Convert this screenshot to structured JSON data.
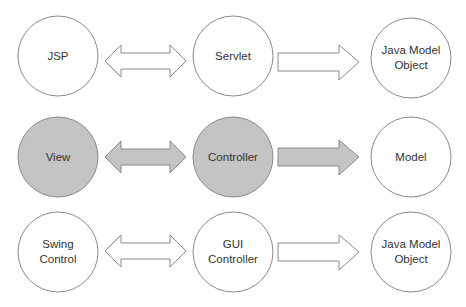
{
  "diagram": {
    "title": "",
    "colors": {
      "stroke": "#8a8a8a",
      "highlight_fill": "#c4c4c4",
      "plain_fill": "#ffffff",
      "text": "#333333"
    },
    "rows": [
      {
        "name": "jsp-row",
        "highlighted": false,
        "nodes": [
          {
            "id": "jsp",
            "label": "JSP"
          },
          {
            "id": "servlet",
            "label": "Servlet"
          },
          {
            "id": "java-model-object-1",
            "label": "Java Model\nObject"
          }
        ],
        "arrows": [
          {
            "from": "jsp",
            "to": "servlet",
            "type": "bidirectional"
          },
          {
            "from": "servlet",
            "to": "java-model-object-1",
            "type": "unidirectional"
          }
        ]
      },
      {
        "name": "mvc-row",
        "highlighted": true,
        "nodes": [
          {
            "id": "view",
            "label": "View"
          },
          {
            "id": "controller",
            "label": "Controller"
          },
          {
            "id": "model",
            "label": "Model"
          }
        ],
        "arrows": [
          {
            "from": "view",
            "to": "controller",
            "type": "bidirectional"
          },
          {
            "from": "controller",
            "to": "model",
            "type": "unidirectional"
          }
        ]
      },
      {
        "name": "swing-row",
        "highlighted": false,
        "nodes": [
          {
            "id": "swing-control",
            "label": "Swing\nControl"
          },
          {
            "id": "gui-controller",
            "label": "GUI\nController"
          },
          {
            "id": "java-model-object-2",
            "label": "Java Model\nObject"
          }
        ],
        "arrows": [
          {
            "from": "swing-control",
            "to": "gui-controller",
            "type": "bidirectional"
          },
          {
            "from": "gui-controller",
            "to": "java-model-object-2",
            "type": "unidirectional"
          }
        ]
      }
    ]
  }
}
